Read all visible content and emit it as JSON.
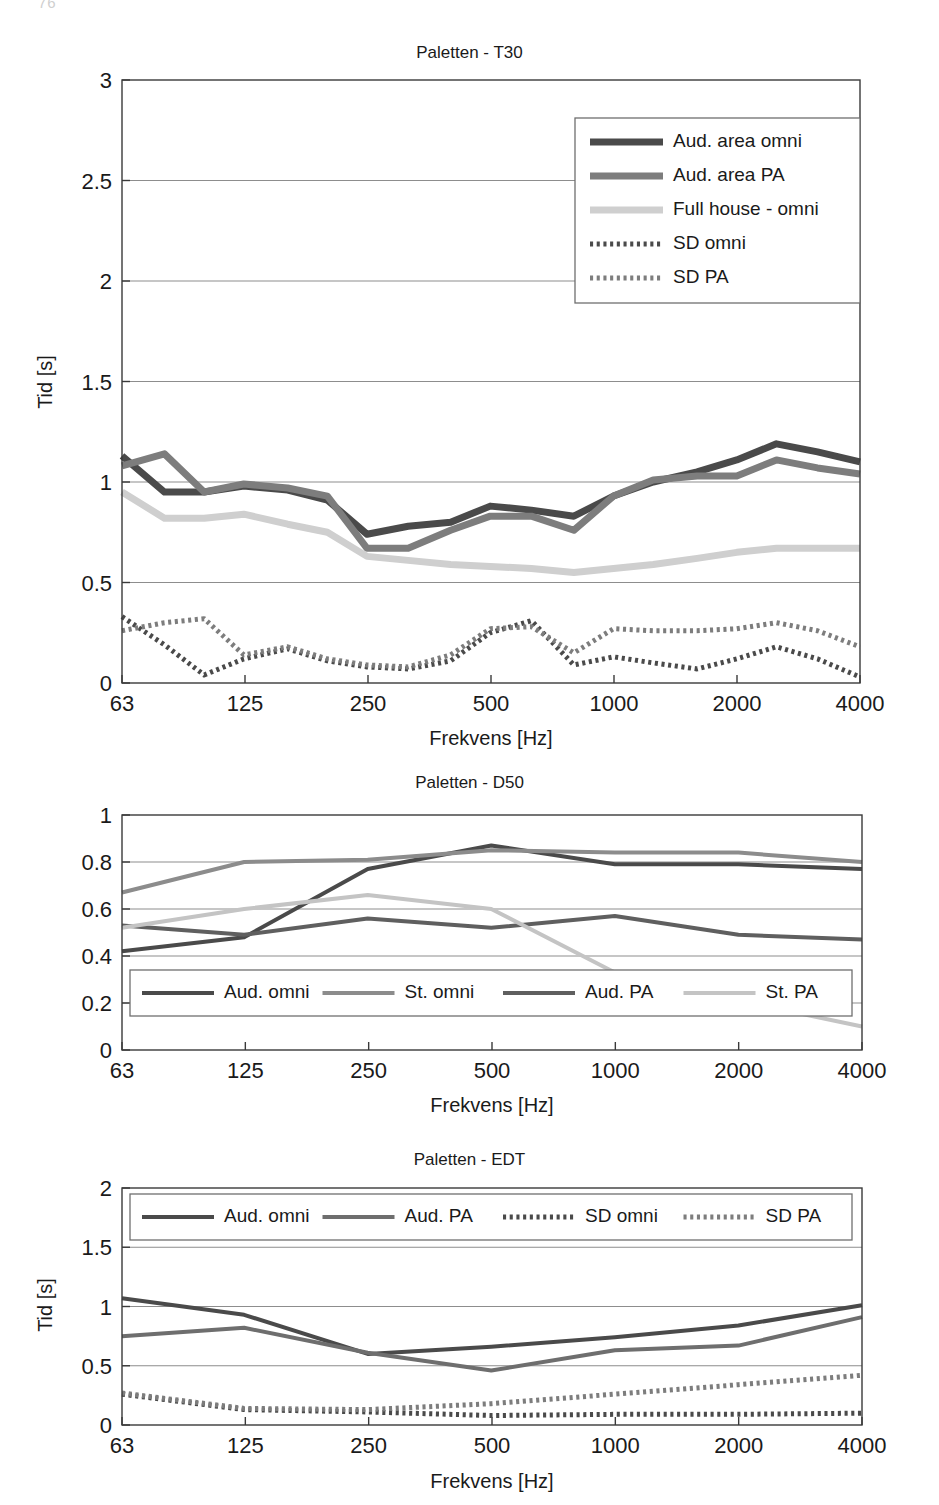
{
  "page_artifact": "76",
  "axis": {
    "xlabel": "Frekvens [Hz]",
    "ylabel_time": "Tid [s]",
    "xticks": [
      "63",
      "125",
      "250",
      "500",
      "1000",
      "2000",
      "4000"
    ]
  },
  "colors": {
    "dark": "#4a4a4a",
    "mid": "#7d7d7d",
    "light": "#cfcfcf",
    "frame": "#3a3a3a",
    "grid": "#8d8d8d"
  },
  "charts": [
    {
      "id": "t30",
      "title": "Paletten - T30",
      "ylabel": "Tid [s]",
      "yticks": [
        "0",
        "0.5",
        "1",
        "1.5",
        "2",
        "2.5",
        "3"
      ],
      "legend_position": "top-right",
      "legend": [
        {
          "label": "Aud. area omni",
          "color": "#4a4a4a",
          "style": "solid",
          "width": 7
        },
        {
          "label": "Aud. area PA",
          "color": "#7d7d7d",
          "style": "solid",
          "width": 7
        },
        {
          "label": "Full house - omni",
          "color": "#cfcfcf",
          "style": "solid",
          "width": 7
        },
        {
          "label": "SD omni",
          "color": "#4a4a4a",
          "style": "dotted",
          "width": 5
        },
        {
          "label": "SD PA",
          "color": "#7d7d7d",
          "style": "dotted",
          "width": 5
        }
      ]
    },
    {
      "id": "d50",
      "title": "Paletten - D50",
      "ylabel": "",
      "yticks": [
        "0",
        "0.2",
        "0.4",
        "0.6",
        "0.8",
        "1"
      ],
      "legend_position": "bottom-inside",
      "legend": [
        {
          "label": "Aud. omni",
          "color": "#4a4a4a",
          "style": "solid",
          "width": 4
        },
        {
          "label": "St. omni",
          "color": "#8c8c8c",
          "style": "solid",
          "width": 4
        },
        {
          "label": "Aud. PA",
          "color": "#5f5f5f",
          "style": "solid",
          "width": 4
        },
        {
          "label": "St. PA",
          "color": "#c4c4c4",
          "style": "solid",
          "width": 4
        }
      ]
    },
    {
      "id": "edt",
      "title": "Paletten - EDT",
      "ylabel": "Tid [s]",
      "yticks": [
        "0",
        "0.5",
        "1",
        "1.5",
        "2"
      ],
      "legend_position": "top-inside",
      "legend": [
        {
          "label": "Aud. omni",
          "color": "#4a4a4a",
          "style": "solid",
          "width": 4
        },
        {
          "label": "Aud. PA",
          "color": "#6e6e6e",
          "style": "solid",
          "width": 4
        },
        {
          "label": "SD omni",
          "color": "#4a4a4a",
          "style": "dotted",
          "width": 5
        },
        {
          "label": "SD PA",
          "color": "#7d7d7d",
          "style": "dotted",
          "width": 5
        }
      ]
    }
  ],
  "chart_data": [
    {
      "type": "line",
      "id": "t30",
      "title": "Paletten - T30",
      "xlabel": "Frekvens [Hz]",
      "ylabel": "Tid [s]",
      "ylim": [
        0,
        3
      ],
      "ytick_values": [
        0,
        0.5,
        1,
        1.5,
        2,
        2.5,
        3
      ],
      "grid": true,
      "legend": "top-right",
      "x": [
        63,
        80,
        100,
        125,
        160,
        200,
        250,
        315,
        400,
        500,
        630,
        800,
        1000,
        1250,
        1600,
        2000,
        2500,
        3150,
        4000
      ],
      "xtick_labels": [
        "63",
        "125",
        "250",
        "500",
        "1000",
        "2000",
        "4000"
      ],
      "series": [
        {
          "name": "Aud. area omni",
          "color": "#4a4a4a",
          "style": "solid",
          "values": [
            1.13,
            0.95,
            0.95,
            0.98,
            0.96,
            0.91,
            0.74,
            0.78,
            0.8,
            0.88,
            0.86,
            0.83,
            0.93,
            1.0,
            1.05,
            1.11,
            1.19,
            1.15,
            1.1
          ]
        },
        {
          "name": "Aud. area PA",
          "color": "#7d7d7d",
          "style": "solid",
          "values": [
            1.08,
            1.14,
            0.95,
            0.99,
            0.97,
            0.93,
            0.67,
            0.67,
            0.76,
            0.83,
            0.83,
            0.76,
            0.93,
            1.01,
            1.03,
            1.03,
            1.11,
            1.07,
            1.04
          ]
        },
        {
          "name": "Full house - omni",
          "color": "#cfcfcf",
          "style": "solid",
          "values": [
            0.95,
            0.82,
            0.82,
            0.84,
            0.79,
            0.75,
            0.63,
            0.61,
            0.59,
            0.58,
            0.57,
            0.55,
            0.57,
            0.59,
            0.62,
            0.65,
            0.67,
            0.67,
            0.67
          ]
        },
        {
          "name": "SD omni",
          "color": "#4a4a4a",
          "style": "dotted",
          "values": [
            0.33,
            0.19,
            0.04,
            0.12,
            0.17,
            0.11,
            0.08,
            0.07,
            0.11,
            0.25,
            0.31,
            0.09,
            0.13,
            0.1,
            0.07,
            0.12,
            0.18,
            0.12,
            0.03
          ]
        },
        {
          "name": "SD PA",
          "color": "#7d7d7d",
          "style": "dotted",
          "values": [
            0.26,
            0.3,
            0.32,
            0.14,
            0.18,
            0.12,
            0.09,
            0.08,
            0.14,
            0.27,
            0.28,
            0.15,
            0.27,
            0.26,
            0.26,
            0.27,
            0.3,
            0.26,
            0.18
          ]
        }
      ]
    },
    {
      "type": "line",
      "id": "d50",
      "title": "Paletten - D50",
      "xlabel": "Frekvens [Hz]",
      "ylabel": "",
      "ylim": [
        0,
        1
      ],
      "ytick_values": [
        0,
        0.2,
        0.4,
        0.6,
        0.8,
        1
      ],
      "grid": true,
      "legend": "bottom-inside",
      "x": [
        63,
        125,
        250,
        500,
        1000,
        2000,
        4000
      ],
      "xtick_labels": [
        "63",
        "125",
        "250",
        "500",
        "1000",
        "2000",
        "4000"
      ],
      "series": [
        {
          "name": "Aud. omni",
          "color": "#4a4a4a",
          "style": "solid",
          "values": [
            0.42,
            0.48,
            0.77,
            0.87,
            0.79,
            0.79,
            0.77
          ]
        },
        {
          "name": "St. omni",
          "color": "#8c8c8c",
          "style": "solid",
          "values": [
            0.67,
            0.8,
            0.81,
            0.85,
            0.84,
            0.84,
            0.8
          ]
        },
        {
          "name": "Aud. PA",
          "color": "#5f5f5f",
          "style": "solid",
          "values": [
            0.53,
            0.49,
            0.56,
            0.52,
            0.57,
            0.49,
            0.47
          ]
        },
        {
          "name": "St. PA",
          "color": "#c4c4c4",
          "style": "solid",
          "values": [
            0.52,
            0.6,
            0.66,
            0.6,
            0.33,
            0.21,
            0.1
          ]
        }
      ]
    },
    {
      "type": "line",
      "id": "edt",
      "title": "Paletten - EDT",
      "xlabel": "Frekvens [Hz]",
      "ylabel": "Tid [s]",
      "ylim": [
        0,
        2
      ],
      "ytick_values": [
        0,
        0.5,
        1,
        1.5,
        2
      ],
      "grid": true,
      "legend": "top-inside",
      "x": [
        63,
        125,
        250,
        500,
        1000,
        2000,
        4000
      ],
      "xtick_labels": [
        "63",
        "125",
        "250",
        "500",
        "1000",
        "2000",
        "4000"
      ],
      "series": [
        {
          "name": "Aud. omni",
          "color": "#4a4a4a",
          "style": "solid",
          "values": [
            1.07,
            0.93,
            0.6,
            0.66,
            0.74,
            0.84,
            1.01
          ]
        },
        {
          "name": "Aud. PA",
          "color": "#6e6e6e",
          "style": "solid",
          "values": [
            0.75,
            0.82,
            0.61,
            0.46,
            0.63,
            0.67,
            0.91
          ]
        },
        {
          "name": "SD omni",
          "color": "#4a4a4a",
          "style": "dotted",
          "values": [
            0.26,
            0.13,
            0.11,
            0.08,
            0.09,
            0.09,
            0.1
          ]
        },
        {
          "name": "SD PA",
          "color": "#7d7d7d",
          "style": "dotted",
          "values": [
            0.27,
            0.14,
            0.13,
            0.18,
            0.26,
            0.34,
            0.42
          ]
        }
      ]
    }
  ]
}
